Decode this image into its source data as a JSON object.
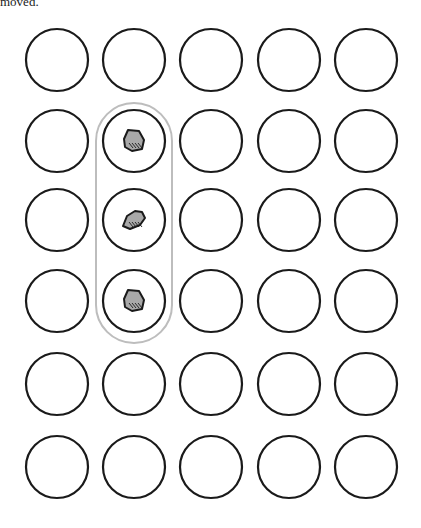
{
  "caption": "moved.",
  "grid": {
    "rows": 6,
    "cols": 5,
    "col_x": [
      57,
      134,
      211,
      289,
      366
    ],
    "row_y": [
      60,
      141,
      220,
      301,
      384,
      467
    ],
    "radius": 31
  },
  "highlight": {
    "col": 1,
    "row_start": 1,
    "row_end": 3,
    "color": "#bdbdbd"
  },
  "stones": [
    {
      "row": 1,
      "col": 1,
      "shape": "stone-large"
    },
    {
      "row": 2,
      "col": 1,
      "shape": "stone-small"
    },
    {
      "row": 3,
      "col": 1,
      "shape": "stone-large"
    }
  ],
  "colors": {
    "stroke": "#1a1a1a",
    "stone_fill": "#a8a8a8"
  }
}
